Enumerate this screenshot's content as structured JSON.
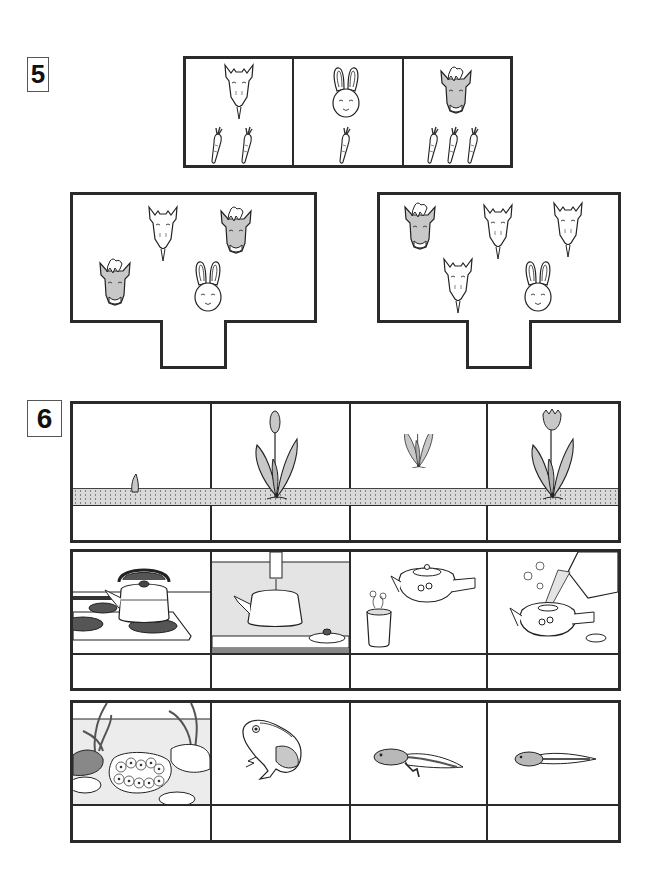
{
  "worksheet": {
    "problem5": {
      "number": "5",
      "legend": [
        {
          "animal": "goat",
          "icon": "goat-icon",
          "carrots": 2
        },
        {
          "animal": "rabbit",
          "icon": "rabbit-icon",
          "carrots": 1
        },
        {
          "animal": "horse",
          "icon": "horse-icon",
          "carrots": 3
        }
      ],
      "scenes": [
        {
          "id": "left",
          "animals": [
            "goat",
            "horse",
            "horse",
            "rabbit"
          ],
          "answer": ""
        },
        {
          "id": "right",
          "animals": [
            "horse",
            "goat",
            "goat",
            "goat",
            "rabbit"
          ],
          "answer": ""
        }
      ]
    },
    "problem6": {
      "number": "6",
      "rows": [
        {
          "topic": "tulip-growth",
          "cells": [
            {
              "image": "sprout-in-soil",
              "answer": ""
            },
            {
              "image": "tulip-bud",
              "answer": ""
            },
            {
              "image": "tulip-leaves",
              "answer": ""
            },
            {
              "image": "tulip-bloom",
              "answer": ""
            }
          ]
        },
        {
          "topic": "making-tea",
          "cells": [
            {
              "image": "kettle-on-stove",
              "answer": ""
            },
            {
              "image": "filling-kettle-at-tap",
              "answer": ""
            },
            {
              "image": "teapot-and-cup-of-tea",
              "answer": ""
            },
            {
              "image": "pouring-water-into-teapot",
              "answer": ""
            }
          ]
        },
        {
          "topic": "frog-life-cycle",
          "cells": [
            {
              "image": "frog-eggs-in-pond",
              "answer": ""
            },
            {
              "image": "adult-frog",
              "answer": ""
            },
            {
              "image": "tadpole-with-legs",
              "answer": ""
            },
            {
              "image": "tadpole",
              "answer": ""
            }
          ]
        }
      ]
    },
    "colors": {
      "line": "#2a2a2a",
      "shade": "#c8c8c8",
      "soil": "#d9d9d9",
      "background": "#ffffff"
    }
  }
}
